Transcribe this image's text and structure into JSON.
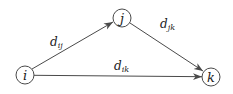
{
  "diagram": {
    "type": "directed-graph",
    "colors": {
      "stroke": "#4a4a4a",
      "text": "#222222",
      "background": "#ffffff"
    },
    "nodes": [
      {
        "id": "i",
        "label": "i",
        "x": 25,
        "y": 75,
        "r": 9
      },
      {
        "id": "j",
        "label": "j",
        "x": 122,
        "y": 18,
        "r": 9
      },
      {
        "id": "k",
        "label": "k",
        "x": 211,
        "y": 77,
        "r": 9
      }
    ],
    "edges": [
      {
        "from": "i",
        "to": "j",
        "label_base": "d",
        "label_sub": "ij",
        "label_x": 50,
        "label_y": 46
      },
      {
        "from": "j",
        "to": "k",
        "label_base": "d",
        "label_sub": "jk",
        "label_x": 160,
        "label_y": 28
      },
      {
        "from": "i",
        "to": "k",
        "label_base": "d",
        "label_sub": "ik",
        "label_x": 114,
        "label_y": 70
      }
    ]
  }
}
